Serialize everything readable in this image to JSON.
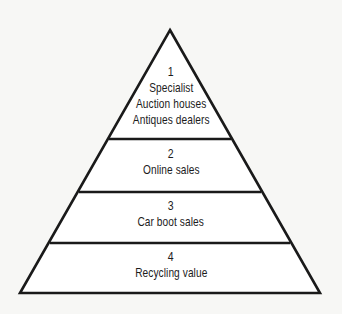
{
  "diagram": {
    "type": "pyramid",
    "colors": {
      "background": "#f7f7f5",
      "stroke": "#1a1a1a",
      "fill": "#ffffff",
      "text": "#1c1c1c"
    },
    "tiers": [
      {
        "number": "1",
        "lines": [
          "Specialist",
          "Auction houses",
          "Antiques dealers"
        ]
      },
      {
        "number": "2",
        "lines": [
          "Online sales"
        ]
      },
      {
        "number": "3",
        "lines": [
          "Car boot sales"
        ]
      },
      {
        "number": "4",
        "lines": [
          "Recycling value"
        ]
      }
    ]
  }
}
